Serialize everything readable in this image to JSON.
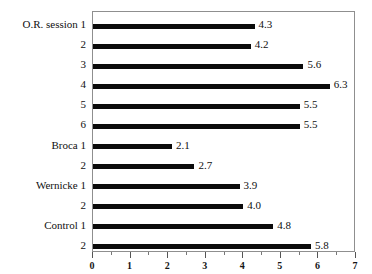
{
  "chart_data": {
    "type": "bar",
    "orientation": "horizontal",
    "title": "",
    "subtitle": "",
    "xlabel": "",
    "ylabel": "",
    "xlim": [
      0,
      7
    ],
    "grid": false,
    "legend": null,
    "x_major_ticks": [
      "0",
      "1",
      "2",
      "3",
      "4",
      "5",
      "6",
      "7"
    ],
    "x_minor_tick_step": 0.5,
    "bar_color": "#0b0b0b",
    "frame_color": "#8f8f8f",
    "background_color": "#ffffff",
    "groups": [
      {
        "name": "O.R. session",
        "items": [
          "1",
          "2",
          "3",
          "4",
          "5",
          "6"
        ]
      },
      {
        "name": "Broca",
        "items": [
          "1",
          "2"
        ]
      },
      {
        "name": "Wernicke",
        "items": [
          "1",
          "2"
        ]
      },
      {
        "name": "Control",
        "items": [
          "1",
          "2"
        ]
      }
    ],
    "categories": [
      "O.R. session 1",
      "2",
      "3",
      "4",
      "5",
      "6",
      "Broca 1",
      "2",
      "Wernicke 1",
      "2",
      "Control 1",
      "2"
    ],
    "values": [
      4.3,
      4.2,
      5.6,
      6.3,
      5.5,
      5.5,
      2.1,
      2.7,
      3.9,
      4.0,
      4.8,
      5.8
    ],
    "value_labels": [
      "4.3",
      "4.2",
      "5.6",
      "6.3",
      "5.5",
      "5.5",
      "2.1",
      "2.7",
      "3.9",
      "4.0",
      "4.8",
      "5.8"
    ]
  }
}
